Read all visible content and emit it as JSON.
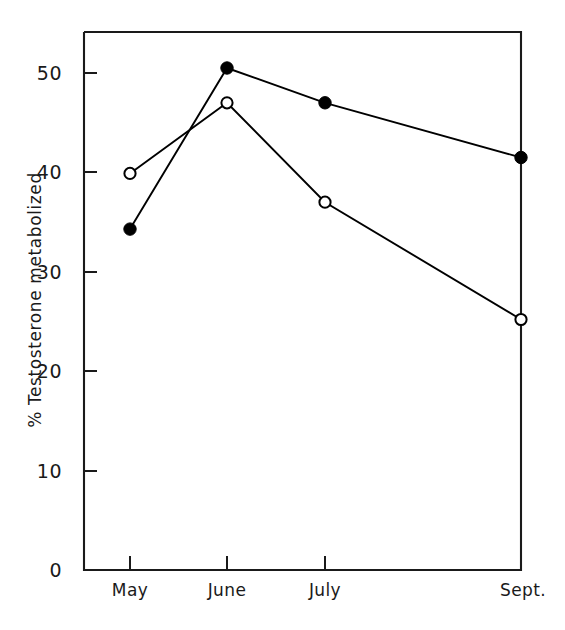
{
  "chart_data": {
    "type": "line",
    "title": "",
    "subtitle": "",
    "xlabel": "",
    "ylabel": "% Testosterone metabolized",
    "categories": [
      "May",
      "June",
      "July",
      "Sept."
    ],
    "x_tick_labels": [
      "May",
      "June",
      "July",
      "Sept."
    ],
    "y_tick_labels": [
      "0",
      "10",
      "20",
      "30",
      "40",
      "50"
    ],
    "y_ticks": [
      0,
      10,
      20,
      30,
      40,
      50
    ],
    "ylim": [
      0,
      55
    ],
    "xlim": [
      0,
      4.5
    ],
    "grid": false,
    "legend": "none",
    "series": [
      {
        "name": "filled-circle-series",
        "marker": "filled-circle",
        "color": "#000000",
        "values": [
          34.3,
          50.5,
          47.0,
          41.5
        ]
      },
      {
        "name": "open-circle-series",
        "marker": "open-circle",
        "color": "#000000",
        "values": [
          39.9,
          47.0,
          37.0,
          25.2
        ]
      }
    ],
    "annotations": []
  },
  "axes": {
    "frame": "box",
    "line_color": "#1a1a1a",
    "background": "#ffffff"
  }
}
